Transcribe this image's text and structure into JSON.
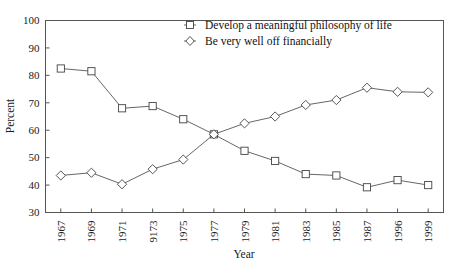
{
  "chart_data": {
    "type": "line",
    "title": "",
    "xlabel": "Year",
    "ylabel": "Percent",
    "ylim": [
      30,
      100
    ],
    "ytick_step": 10,
    "yticks": [
      "30",
      "40",
      "50",
      "60",
      "70",
      "80",
      "90",
      "100"
    ],
    "grid": false,
    "legend_position": "top-center",
    "categories": [
      "1967",
      "1969",
      "1971",
      "9173",
      "1975",
      "1977",
      "1979",
      "1981",
      "1983",
      "1985",
      "1987",
      "1996",
      "1999"
    ],
    "series": [
      {
        "name": "Develop a meaningful philosophy of life",
        "marker": "square",
        "values": [
          82.5,
          81.5,
          68.0,
          68.8,
          64.0,
          58.5,
          52.5,
          48.8,
          44.0,
          43.5,
          39.2,
          41.8,
          40.0
        ]
      },
      {
        "name": "Be very well off financially",
        "marker": "diamond",
        "values": [
          43.5,
          44.5,
          40.3,
          45.8,
          49.3,
          58.5,
          62.5,
          65.0,
          69.2,
          71.0,
          75.5,
          74.0,
          73.8
        ]
      }
    ]
  },
  "legend": {
    "entries": [
      {
        "label": "Develop a meaningful philosophy of life",
        "marker": "square-marker"
      },
      {
        "label": "Be very well off financially",
        "marker": "diamond-marker"
      }
    ]
  },
  "colors": {
    "line": "#555555",
    "marker_fill": "#ffffff",
    "marker_stroke": "#444444",
    "axis": "#555555",
    "text": "#1a1a1a",
    "background": "#ffffff"
  }
}
